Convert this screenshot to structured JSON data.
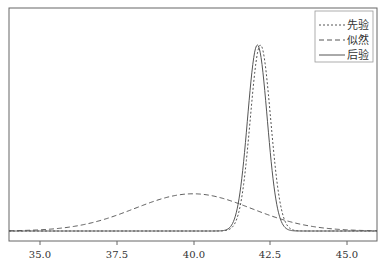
{
  "chart_data": {
    "type": "line",
    "title": "",
    "xlabel": "",
    "ylabel": "",
    "xlim": [
      34.0,
      46.0
    ],
    "ylim": [
      0,
      1.05
    ],
    "grid": false,
    "legend_position": "upper right",
    "x_ticks": [
      "35.0",
      "37.5",
      "40.0",
      "42.5",
      "45.0"
    ],
    "x_tick_values": [
      35.0,
      37.5,
      40.0,
      42.5,
      45.0
    ],
    "series": [
      {
        "name": "先验",
        "style": "dotted",
        "mean": 42.2,
        "sd": 0.33,
        "peak": 1.0
      },
      {
        "name": "似然",
        "style": "dashed",
        "mean": 40.0,
        "sd": 1.9,
        "peak": 0.2
      },
      {
        "name": "后验",
        "style": "solid",
        "mean": 42.1,
        "sd": 0.32,
        "peak": 1.0
      }
    ]
  },
  "legend": {
    "items": [
      {
        "label": "先验",
        "style": "dotted"
      },
      {
        "label": "似然",
        "style": "dashed"
      },
      {
        "label": "后验",
        "style": "solid"
      }
    ]
  },
  "axis": {
    "ticks": [
      {
        "label": "35.0"
      },
      {
        "label": "37.5"
      },
      {
        "label": "40.0"
      },
      {
        "label": "42.5"
      },
      {
        "label": "45.0"
      }
    ]
  }
}
